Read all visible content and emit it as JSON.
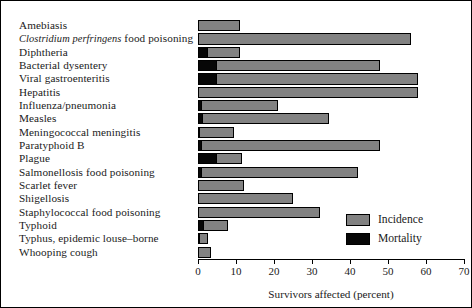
{
  "chart_data": {
    "type": "bar",
    "orientation": "horizontal",
    "title": "",
    "xlabel": "Survivors affected (percent)",
    "ylabel": "",
    "xlim": [
      0,
      70
    ],
    "xticks": [
      0,
      10,
      20,
      30,
      40,
      50,
      60,
      70
    ],
    "grid": false,
    "legend_position": "inside-lower-right",
    "colors": {
      "incidence": "#828282",
      "mortality": "#070707",
      "axis": "#000000",
      "background": "#ffffff"
    },
    "legend": [
      {
        "label": "Incidence",
        "color": "#828282"
      },
      {
        "label": "Mortality",
        "color": "#070707"
      }
    ],
    "categories": [
      "Amebiasis",
      "Clostridium perfringens food poisoning",
      "Diphtheria",
      "Bacterial dysentery",
      "Viral gastroenteritis",
      "Hepatitis",
      "Influenza/pneumonia",
      "Measles",
      "Meningococcal meningitis",
      "Paratyphoid B",
      "Plague",
      "Salmonellosis food poisoning",
      "Scarlet fever",
      "Shigellosis",
      "Staphylococcal food poisoning",
      "Typhoid",
      "Typhus, epidemic louse-borne",
      "Whooping cough"
    ],
    "series": [
      {
        "name": "Incidence",
        "values": [
          11,
          56,
          11,
          48,
          58,
          58,
          21,
          34.5,
          9.5,
          48,
          11.5,
          42,
          12,
          25,
          32,
          8,
          2.5,
          3.5
        ]
      },
      {
        "name": "Mortality",
        "values": [
          0,
          0,
          2.6,
          5,
          5,
          0,
          1,
          1.2,
          0.6,
          1,
          5,
          1,
          0,
          0,
          0,
          1.5,
          0.6,
          0
        ]
      }
    ]
  },
  "labels": {
    "rows": [
      {
        "text": "Amebiasis",
        "italic_prefix": ""
      },
      {
        "text": " food poisoning",
        "italic_prefix": "Clostridium perfringens"
      },
      {
        "text": "Diphtheria",
        "italic_prefix": ""
      },
      {
        "text": "Bacterial dysentery",
        "italic_prefix": ""
      },
      {
        "text": "Viral gastroenteritis",
        "italic_prefix": ""
      },
      {
        "text": "Hepatitis",
        "italic_prefix": ""
      },
      {
        "text": "Influenza/pneumonia",
        "italic_prefix": ""
      },
      {
        "text": "Measles",
        "italic_prefix": ""
      },
      {
        "text": "Meningococcal meningitis",
        "italic_prefix": ""
      },
      {
        "text": "Paratyphoid B",
        "italic_prefix": ""
      },
      {
        "text": "Plague",
        "italic_prefix": ""
      },
      {
        "text": "Salmonellosis food poisoning",
        "italic_prefix": ""
      },
      {
        "text": "Scarlet fever",
        "italic_prefix": ""
      },
      {
        "text": "Shigellosis",
        "italic_prefix": ""
      },
      {
        "text": "Staphylococcal food poisoning",
        "italic_prefix": ""
      },
      {
        "text": "Typhoid",
        "italic_prefix": ""
      },
      {
        "text": "Typhus, epidemic louse–borne",
        "italic_prefix": ""
      },
      {
        "text": "Whooping cough",
        "italic_prefix": ""
      }
    ]
  }
}
